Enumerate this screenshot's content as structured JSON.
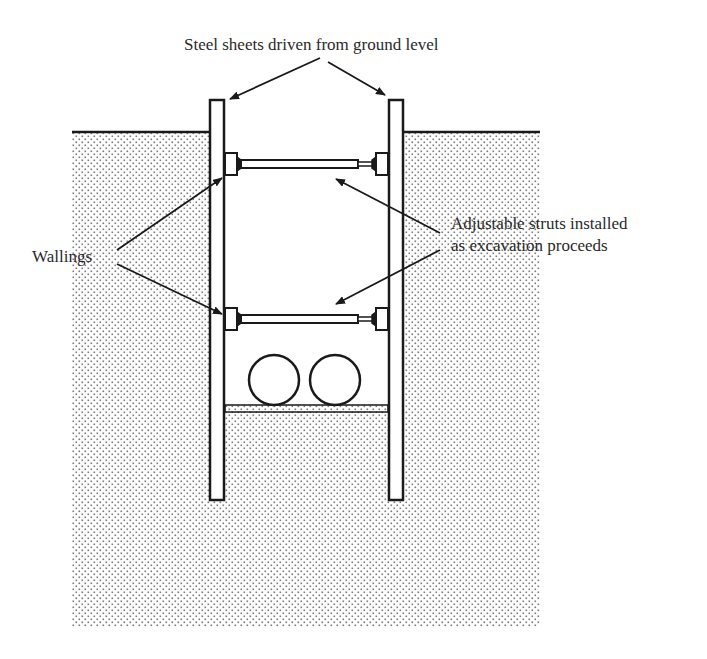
{
  "diagram": {
    "labels": {
      "steel_sheets": "Steel sheets driven from ground level",
      "wallings": "Wallings",
      "struts_line1": "Adjustable struts installed",
      "struts_line2": "as excavation proceeds"
    },
    "components": [
      "ground-surface",
      "soil",
      "left-steel-sheet",
      "right-steel-sheet",
      "upper-strut",
      "lower-strut",
      "wallings",
      "pipes",
      "pipe-bedding"
    ],
    "colors": {
      "line": "#1a1a1a",
      "soil_dot": "#7a7a7a",
      "background": "#ffffff"
    }
  }
}
